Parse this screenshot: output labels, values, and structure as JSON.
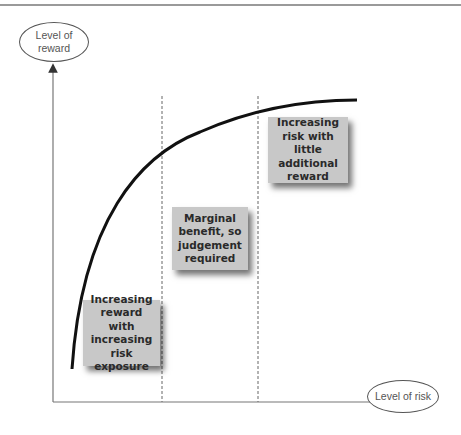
{
  "diagram": {
    "type": "risk-reward curve",
    "y_axis_label": "Level of\nreward",
    "x_axis_label": "Level of risk",
    "zones": [
      {
        "label": "Increasing\nreward with\nincreasing\nrisk exposure"
      },
      {
        "label": "Marginal\nbenefit, so\njudgement\nrequired"
      },
      {
        "label": "Increasing\nrisk with little\nadditional\nreward"
      }
    ],
    "colors": {
      "box_fill": "#c8c8c8",
      "curve": "#111111",
      "axis": "#555555",
      "divider": "#555555"
    }
  }
}
